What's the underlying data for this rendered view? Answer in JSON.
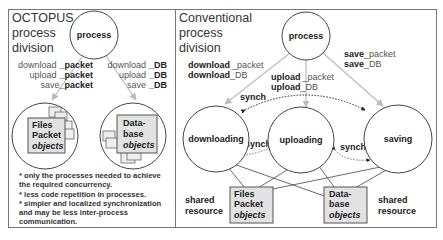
{
  "left_panel": {
    "title_lines": [
      "OCTOPUS",
      "process",
      "division"
    ],
    "process_node": "process",
    "packet_labels": [
      {
        "prefix": "download",
        "suffix": "_packet"
      },
      {
        "prefix": "upload",
        "suffix": "_packet"
      },
      {
        "prefix": "save",
        "suffix": "_packet"
      }
    ],
    "db_labels": [
      {
        "prefix": "download",
        "suffix": "_DB"
      },
      {
        "prefix": "upload",
        "suffix": "_DB"
      },
      {
        "prefix": "save",
        "suffix": "_DB"
      }
    ],
    "files_object": {
      "line1": "Files",
      "line2": "Packet",
      "line3": "objects"
    },
    "db_object": {
      "line1": "Data-",
      "line2": "base",
      "line3": "objects"
    },
    "notes": [
      "* only the processes needed to achieve",
      "the required concurrency.",
      "* less code repetition in processes.",
      "* simpler and localized synchronization",
      "and may be less inter-process",
      "communication."
    ]
  },
  "right_panel": {
    "title_lines": [
      "Conventional",
      "process",
      "division"
    ],
    "process_node": "process",
    "download_labels": [
      {
        "prefix": "download",
        "suffix": "_packet"
      },
      {
        "prefix": "download",
        "suffix": "_DB"
      }
    ],
    "upload_labels": [
      {
        "prefix": "upload",
        "suffix": "_packet"
      },
      {
        "prefix": "upload",
        "suffix": "_DB"
      }
    ],
    "save_labels": [
      {
        "prefix": "save",
        "suffix": "_packet"
      },
      {
        "prefix": "save",
        "suffix": "_DB"
      }
    ],
    "nodes": [
      "downloading",
      "uploading",
      "saving"
    ],
    "sync_labels": [
      "synch",
      "synch",
      "synch"
    ],
    "shared_resource_left": [
      "shared",
      "resource"
    ],
    "shared_resource_right": [
      "shared",
      "resource"
    ],
    "files_object": {
      "line1": "Files",
      "line2": "Packet",
      "line3": "objects"
    },
    "db_object": {
      "line1": "Data-",
      "line2": "base",
      "line3": "objects"
    }
  },
  "colors": {
    "frame": "#777777",
    "object_fill": "#e2e2e2",
    "arrow": "#bbbbbb",
    "text": "#222222"
  }
}
